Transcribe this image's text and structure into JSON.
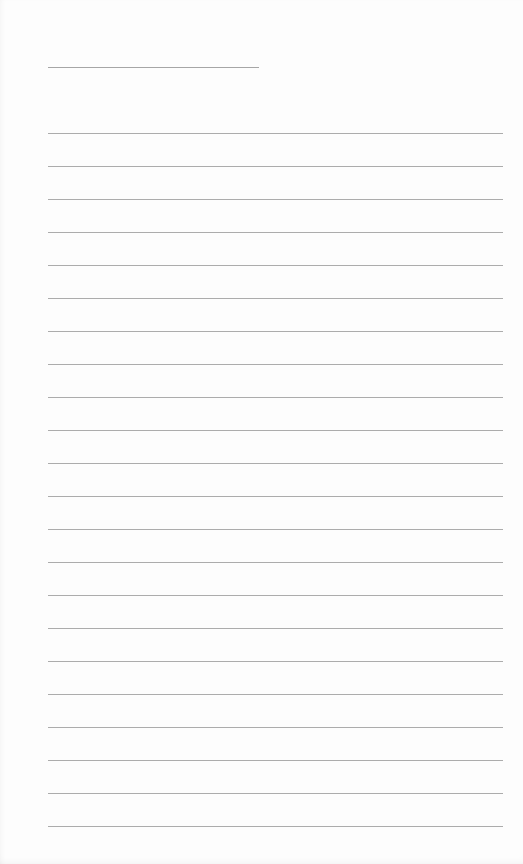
{
  "page": {
    "type": "blank lined writing page",
    "background_color": "#fdfdfd",
    "line_color": "#acacac",
    "title_line": {
      "x": 48,
      "y": 67,
      "width": 211
    },
    "rules": {
      "count": 22,
      "x": 48,
      "width": 455,
      "first_y": 133,
      "spacing": 33
    }
  }
}
